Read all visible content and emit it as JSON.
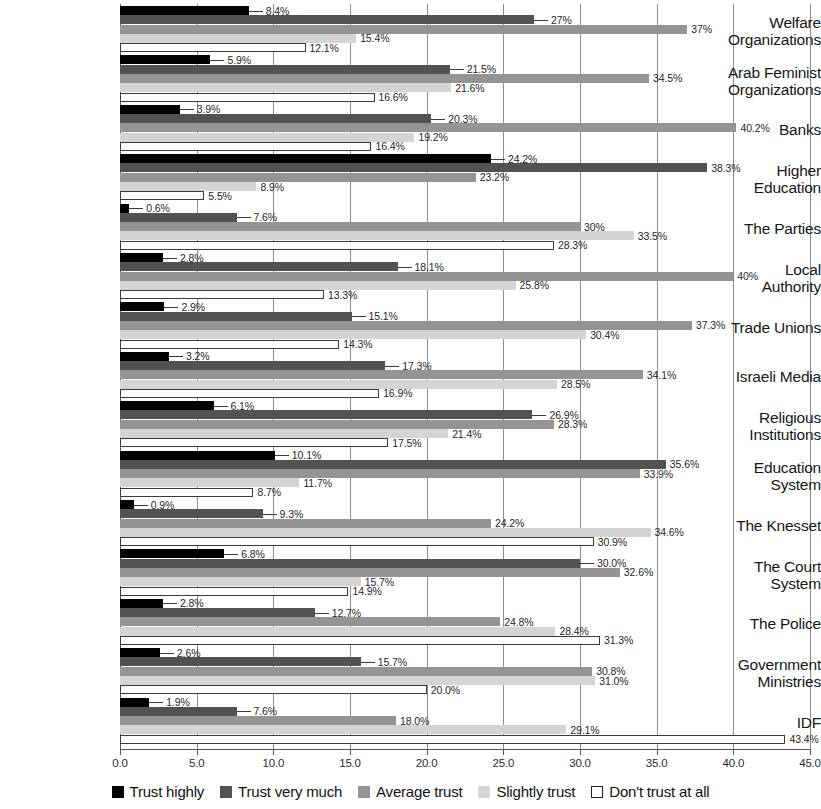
{
  "chart_data": {
    "type": "bar",
    "orientation": "horizontal",
    "title": "",
    "subtitle": "",
    "xlabel": "",
    "ylabel": "",
    "xlim": [
      0,
      45
    ],
    "xtick_step": 5,
    "xticks": [
      "0.0",
      "5.0",
      "10.0",
      "15.0",
      "20.0",
      "25.0",
      "30.0",
      "35.0",
      "40.0",
      "45.0"
    ],
    "grid": "vertical",
    "legend_position": "bottom",
    "value_suffix": "%",
    "categories": [
      "Welfare Organizations",
      "Arab Feminist Organizations",
      "Banks",
      "Higher Education",
      "The Parties",
      "Local Authority",
      "Trade Unions",
      "Israeli Media",
      "Religious Institutions",
      "Education System",
      "The Knesset",
      "The Court System",
      "The Police",
      "Government Ministries",
      "IDF"
    ],
    "category_lines": [
      [
        "Welfare",
        "Organizations"
      ],
      [
        "Arab Feminist",
        "Organizations"
      ],
      [
        "Banks"
      ],
      [
        "Higher",
        "Education"
      ],
      [
        "The Parties"
      ],
      [
        "Local",
        "Authority"
      ],
      [
        "Trade Unions"
      ],
      [
        "Israeli Media"
      ],
      [
        "Religious",
        "Institutions"
      ],
      [
        "Education",
        "System"
      ],
      [
        "The Knesset"
      ],
      [
        "The Court",
        "System"
      ],
      [
        "The Police"
      ],
      [
        "Government",
        "Ministries"
      ],
      [
        "IDF"
      ]
    ],
    "series": [
      {
        "name": "Trust highly",
        "color": "#000000",
        "values": [
          8.4,
          5.9,
          3.9,
          24.2,
          0.6,
          2.8,
          2.9,
          3.2,
          6.1,
          10.1,
          0.9,
          6.8,
          2.8,
          2.6,
          1.9
        ],
        "labels": [
          "8.4%",
          "5.9%",
          "3.9%",
          "24.2%",
          "0.6%",
          "2.8%",
          "2.9%",
          "3.2%",
          "6.1%",
          "10.1%",
          "0.9%",
          "6.8%",
          "2.8%",
          "2.6%",
          "1.9%"
        ]
      },
      {
        "name": "Trust very much",
        "color": "#525252",
        "values": [
          27.0,
          21.5,
          20.3,
          38.3,
          7.6,
          18.1,
          15.1,
          17.3,
          26.9,
          35.6,
          9.3,
          30.0,
          12.7,
          15.7,
          7.6
        ],
        "labels": [
          "27%",
          "21.5%",
          "20.3%",
          "38.3%",
          "7.6%",
          "18.1%",
          "15.1%",
          "17.3%",
          "26.9%",
          "35.6%",
          "9.3%",
          "30.0%",
          "12.7%",
          "15.7%",
          "7.6%"
        ]
      },
      {
        "name": "Average trust",
        "color": "#949494",
        "values": [
          37.0,
          34.5,
          40.2,
          23.2,
          30.0,
          40.0,
          37.3,
          34.1,
          28.3,
          33.9,
          24.2,
          32.6,
          24.8,
          30.8,
          18.0
        ],
        "labels": [
          "37%",
          "34.5%",
          "40.2%",
          "23.2%",
          "30%",
          "40%",
          "37.3%",
          "34.1%",
          "28.3%",
          "33.9%",
          "24.2%",
          "32.6%",
          "24.8%",
          "30.8%",
          "18.0%"
        ]
      },
      {
        "name": "Slightly trust",
        "color": "#d4d4d4",
        "values": [
          15.4,
          21.6,
          19.2,
          8.9,
          33.5,
          25.8,
          30.4,
          28.5,
          21.4,
          11.7,
          34.6,
          15.7,
          28.4,
          31.0,
          29.1
        ],
        "labels": [
          "15.4%",
          "21.6%",
          "19.2%",
          "8.9%",
          "33.5%",
          "25.8%",
          "30.4%",
          "28.5%",
          "21.4%",
          "11.7%",
          "34.6%",
          "15.7%",
          "28.4%",
          "31.0%",
          "29.1%"
        ]
      },
      {
        "name": "Don't trust at all",
        "color": "#ffffff",
        "values": [
          12.1,
          16.6,
          16.4,
          5.5,
          28.3,
          13.3,
          14.3,
          16.9,
          17.5,
          8.7,
          30.9,
          14.9,
          31.3,
          20.0,
          43.4
        ],
        "labels": [
          "12.1%",
          "16.6%",
          "16.4%",
          "5.5%",
          "28.3%",
          "13.3%",
          "14.3%",
          "16.9%",
          "17.5%",
          "8.7%",
          "30.9%",
          "14.9%",
          "31.3%",
          "20.0%",
          "43.4%"
        ]
      }
    ]
  },
  "legend": {
    "items": [
      {
        "label": "Trust highly",
        "swatch": "legend-swatch-black"
      },
      {
        "label": "Trust very much",
        "swatch": "legend-swatch-dark-gray"
      },
      {
        "label": "Average trust",
        "swatch": "legend-swatch-mid-gray"
      },
      {
        "label": "Slightly trust",
        "swatch": "legend-swatch-light-gray"
      },
      {
        "label": "Don't trust at all",
        "swatch": "legend-swatch-outline"
      }
    ]
  }
}
